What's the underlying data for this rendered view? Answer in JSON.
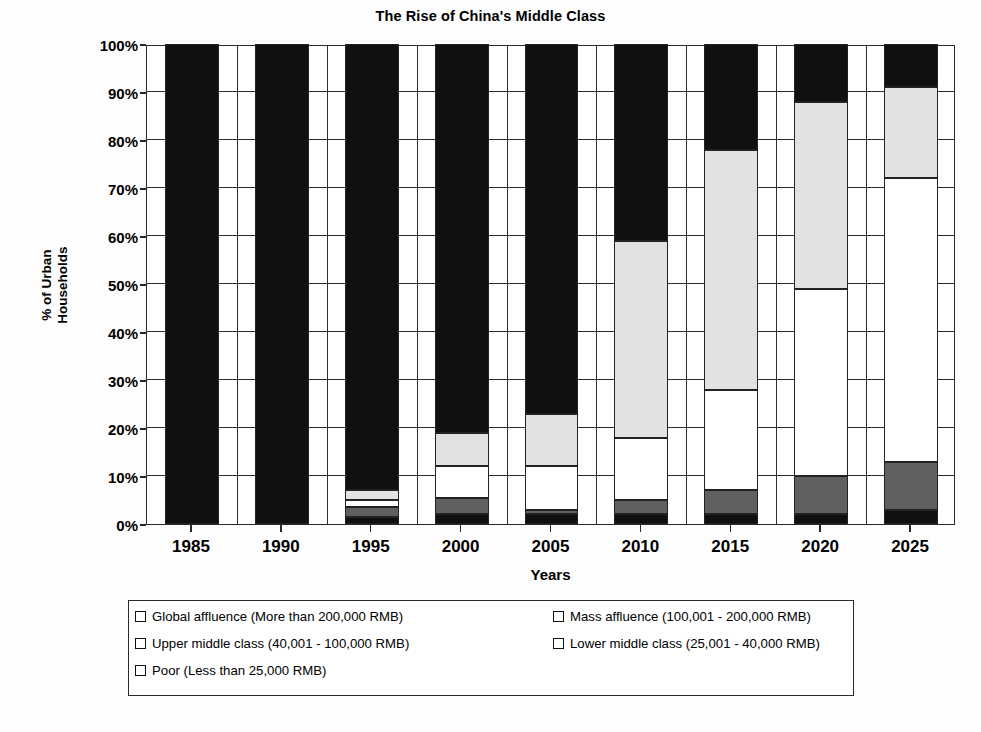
{
  "chart_data": {
    "type": "bar",
    "subtype": "stacked-percent",
    "title": "The Rise of China's Middle Class",
    "xlabel": "Years",
    "ylabel": "% of Urban Households",
    "grid": true,
    "legend_position": "bottom",
    "ylim": [
      0,
      100
    ],
    "ytick_labels": [
      "0%",
      "10%",
      "20%",
      "30%",
      "40%",
      "50%",
      "60%",
      "70%",
      "80%",
      "90%",
      "100%"
    ],
    "ytick_values": [
      0,
      10,
      20,
      30,
      40,
      50,
      60,
      70,
      80,
      90,
      100
    ],
    "categories": [
      "1985",
      "1990",
      "1995",
      "2000",
      "2005",
      "2010",
      "2015",
      "2020",
      "2025"
    ],
    "series": [
      {
        "name": "Poor (Less than 25,000 RMB)",
        "key": "poor",
        "color": "#101010",
        "values": [
          100,
          100,
          1.5,
          2,
          2,
          2,
          2,
          2,
          3
        ]
      },
      {
        "name": "Mass affluence (100,001 - 200,000 RMB)",
        "key": "mass_affluence",
        "color": "#606060",
        "values": [
          0,
          0,
          2,
          3.5,
          1,
          3,
          5,
          8,
          10
        ]
      },
      {
        "name": "Upper middle class (40,001 - 100,000 RMB)",
        "key": "upper_middle",
        "color": "#ffffff",
        "values": [
          0,
          0,
          1.5,
          6.5,
          9,
          13,
          21,
          39,
          59
        ]
      },
      {
        "name": "Lower middle class (25,001 - 40,000 RMB)",
        "key": "lower_middle",
        "color": "#e2e2e2",
        "values": [
          0,
          0,
          2,
          7,
          11,
          41,
          50,
          39,
          19
        ]
      },
      {
        "name": "Global affluence (More than 200,000 RMB)",
        "key": "global_affluence",
        "color": "#101010",
        "values": [
          0,
          0,
          93,
          81,
          77,
          41,
          22,
          12,
          9
        ]
      }
    ],
    "cumulative_tops": {
      "1985": {
        "poor": 100
      },
      "1990": {
        "poor": 100
      },
      "1995": {
        "poor": 1.5,
        "mass_affluence": 3.5,
        "upper_middle": 5,
        "lower_middle": 7,
        "global_affluence": 100
      },
      "2000": {
        "poor": 2,
        "mass_affluence": 5.5,
        "upper_middle": 12,
        "lower_middle": 19,
        "global_affluence": 100
      },
      "2005": {
        "poor": 2,
        "mass_affluence": 3,
        "upper_middle": 12,
        "lower_middle": 23,
        "global_affluence": 100
      },
      "2010": {
        "poor": 2,
        "mass_affluence": 5,
        "upper_middle": 18,
        "lower_middle": 59,
        "global_affluence": 100
      },
      "2015": {
        "poor": 2,
        "mass_affluence": 7,
        "upper_middle": 28,
        "lower_middle": 78,
        "global_affluence": 100
      },
      "2020": {
        "poor": 2,
        "mass_affluence": 10,
        "upper_middle": 49,
        "lower_middle": 88,
        "global_affluence": 100
      },
      "2025": {
        "poor": 3,
        "mass_affluence": 13,
        "upper_middle": 72,
        "lower_middle": 91,
        "global_affluence": 100
      }
    }
  },
  "legend": {
    "items": [
      {
        "label": "Global affluence (More than 200,000 RMB)",
        "fill": "#101010",
        "col": 0,
        "row": 0
      },
      {
        "label": "Mass affluence (100,001 - 200,000 RMB)",
        "fill": "#606060",
        "col": 1,
        "row": 0
      },
      {
        "label": "Upper middle class (40,001 - 100,000 RMB)",
        "fill": "#ffffff",
        "col": 0,
        "row": 1
      },
      {
        "label": "Lower middle class (25,001 - 40,000 RMB)",
        "fill": "#f4f4f4",
        "col": 1,
        "row": 1
      },
      {
        "label": "Poor (Less than 25,000 RMB)",
        "fill": "#101010",
        "col": 0,
        "row": 2
      }
    ]
  },
  "colors": {
    "axis": "#2a2a2a",
    "grid": "#2e2e2e",
    "background": "#fdfdfd",
    "plot_background": "#ffffff"
  }
}
